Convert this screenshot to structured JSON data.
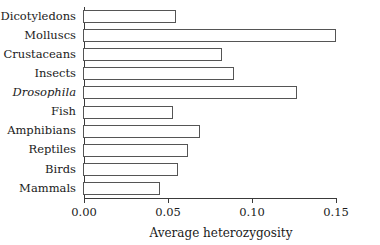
{
  "chart_data": {
    "type": "bar",
    "orientation": "horizontal",
    "title": "",
    "xlabel": "Average heterozygosity",
    "ylabel": "",
    "xlim": [
      0.0,
      0.15
    ],
    "xticks": [
      "0.00",
      "0.05",
      "0.10",
      "0.15"
    ],
    "xtick_values": [
      0.0,
      0.05,
      0.1,
      0.15
    ],
    "grid": false,
    "legend": null,
    "bar_style": {
      "fill": "#ffffff",
      "edge": "#555555"
    },
    "categories": [
      "Dicotyledons",
      "Molluscs",
      "Crustaceans",
      "Insects",
      "Drosophila",
      "Fish",
      "Amphibians",
      "Reptiles",
      "Birds",
      "Mammals"
    ],
    "values": [
      0.055,
      0.15,
      0.082,
      0.089,
      0.127,
      0.053,
      0.069,
      0.062,
      0.056,
      0.045
    ],
    "italic_categories": [
      "Drosophila"
    ],
    "bars": [
      {
        "label": "Dicotyledons",
        "value": 0.055,
        "italic": false
      },
      {
        "label": "Molluscs",
        "value": 0.15,
        "italic": false
      },
      {
        "label": "Crustaceans",
        "value": 0.082,
        "italic": false
      },
      {
        "label": "Insects",
        "value": 0.089,
        "italic": false
      },
      {
        "label": "Drosophila",
        "value": 0.127,
        "italic": true
      },
      {
        "label": "Fish",
        "value": 0.053,
        "italic": false
      },
      {
        "label": "Amphibians",
        "value": 0.069,
        "italic": false
      },
      {
        "label": "Reptiles",
        "value": 0.062,
        "italic": false
      },
      {
        "label": "Birds",
        "value": 0.056,
        "italic": false
      },
      {
        "label": "Mammals",
        "value": 0.045,
        "italic": false
      }
    ]
  }
}
